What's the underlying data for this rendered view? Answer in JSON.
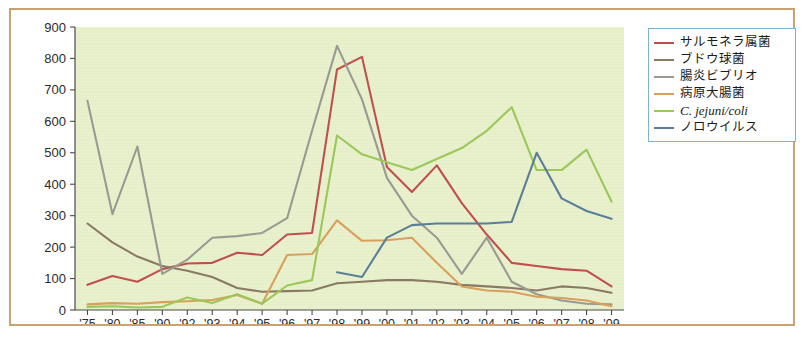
{
  "figure": {
    "border_color": "#c8a271",
    "plot_background": "#e9f1cd",
    "axis_color": "#4a4a4a"
  },
  "legend": {
    "position": "top-right",
    "border_color": "#7fb3d5",
    "items": [
      {
        "label": "サルモネラ属菌",
        "color": "#c0504d",
        "italic": false
      },
      {
        "label": "ブドウ球菌",
        "color": "#8a7a63",
        "italic": false
      },
      {
        "label": "腸炎ビブリオ",
        "color": "#9a9a94",
        "italic": false
      },
      {
        "label": "病原大腸菌",
        "color": "#d9a05b",
        "italic": false
      },
      {
        "label": "C. jejuni/coli",
        "color": "#9ac85a",
        "italic": true
      },
      {
        "label": "ノロウイルス",
        "color": "#5a7f96",
        "italic": false
      }
    ]
  },
  "chart_data": {
    "type": "line",
    "title": "",
    "xlabel": "",
    "ylabel": "",
    "ylim": [
      0,
      900
    ],
    "ytick_step": 100,
    "yticks": [
      0,
      100,
      200,
      300,
      400,
      500,
      600,
      700,
      800,
      900
    ],
    "grid": false,
    "legend_position": "top-right",
    "categories": [
      "'75",
      "'80",
      "'85",
      "'90",
      "'92",
      "'93",
      "'94",
      "'95",
      "'96",
      "'97",
      "'98",
      "'99",
      "'00",
      "'01",
      "'02",
      "'03",
      "'04",
      "'05",
      "'06",
      "'07",
      "'08",
      "'09"
    ],
    "series": [
      {
        "name": "サルモネラ属菌",
        "color": "#c0504d",
        "values": [
          80,
          108,
          90,
          130,
          148,
          150,
          182,
          175,
          240,
          245,
          765,
          805,
          455,
          375,
          460,
          340,
          240,
          150,
          140,
          130,
          125,
          75
        ]
      },
      {
        "name": "ブドウ球菌",
        "color": "#8a7a63",
        "values": [
          275,
          215,
          170,
          140,
          125,
          105,
          70,
          58,
          60,
          62,
          85,
          90,
          95,
          95,
          90,
          80,
          75,
          70,
          62,
          75,
          70,
          55
        ]
      },
      {
        "name": "腸炎ビブリオ",
        "color": "#9a9a94",
        "values": [
          665,
          305,
          520,
          115,
          160,
          230,
          235,
          245,
          292,
          570,
          840,
          670,
          420,
          300,
          230,
          115,
          230,
          90,
          50,
          30,
          20,
          18
        ]
      },
      {
        "name": "病原大腸菌",
        "color": "#d9a05b",
        "values": [
          18,
          22,
          20,
          25,
          28,
          32,
          48,
          20,
          175,
          178,
          285,
          220,
          222,
          230,
          150,
          75,
          62,
          58,
          42,
          38,
          30,
          12
        ]
      },
      {
        "name": "C. jejuni/coli",
        "color": "#9ac85a",
        "values": [
          10,
          12,
          8,
          10,
          40,
          22,
          50,
          20,
          78,
          95,
          555,
          495,
          470,
          445,
          480,
          515,
          570,
          645,
          445,
          445,
          510,
          345
        ]
      },
      {
        "name": "ノロウイルス",
        "color": "#5a7f96",
        "values": [
          null,
          null,
          null,
          null,
          null,
          null,
          null,
          null,
          null,
          null,
          120,
          105,
          230,
          270,
          275,
          275,
          275,
          280,
          500,
          355,
          315,
          290
        ]
      }
    ]
  }
}
